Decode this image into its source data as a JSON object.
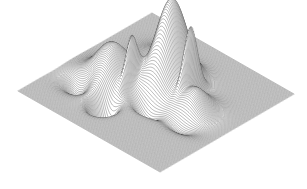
{
  "figure": {
    "title": "",
    "background_color": "#ffffff",
    "mesh_color": "#2b2b2b",
    "fill_color": "#ffffff",
    "width_px": 307,
    "height_px": 189
  },
  "chart_data": {
    "type": "surface",
    "render_style": "wireframe-mesh",
    "title": "",
    "subtitle": "",
    "xlabel": "",
    "ylabel": "",
    "zlabel": "",
    "legend": [],
    "annotations": [],
    "grid": false,
    "axes_visible": false,
    "tick_labels": [],
    "colormap": "grayscale",
    "xlim": [
      -3,
      3
    ],
    "ylim": [
      -3,
      3
    ],
    "zlim": [
      -6.5,
      8.5
    ],
    "grid_resolution": {
      "nx": 170,
      "ny": 170
    },
    "projection": {
      "type": "isometric-diamond",
      "azimuth_deg": -37.5,
      "elevation_deg": 30,
      "corners_px": {
        "left": [
          18,
          91
        ],
        "top": [
          152,
          13
        ],
        "right": [
          297,
          88
        ],
        "bottom": [
          160,
          172
        ]
      },
      "z_scale_px": 9.2,
      "origin_px": [
        156,
        92
      ]
    },
    "surface_function": "sum of anisotropic gaussians on a flat base plane",
    "components": [
      {
        "name": "main-central-peak",
        "amplitude": 9.4,
        "cx": 0.08,
        "cy": 0.62,
        "sx": 0.62,
        "sy": 0.74,
        "rot_deg": 0
      },
      {
        "name": "narrow-right-spike",
        "amplitude": 6.1,
        "cx": 0.98,
        "cy": 0.52,
        "sx": 0.11,
        "sy": 0.4,
        "rot_deg": 0
      },
      {
        "name": "narrow-left-spike",
        "amplitude": 4.3,
        "cx": -0.62,
        "cy": -0.44,
        "sx": 0.1,
        "sy": 0.34,
        "rot_deg": 0
      },
      {
        "name": "broad-left-bump",
        "amplitude": 4.0,
        "cx": -1.42,
        "cy": -0.52,
        "sx": 0.78,
        "sy": 0.86,
        "rot_deg": 0
      },
      {
        "name": "right-shoulder-ridge",
        "amplitude": 2.5,
        "cx": 1.52,
        "cy": 0.1,
        "sx": 0.62,
        "sy": 0.62,
        "rot_deg": 0
      },
      {
        "name": "deep-front-dip",
        "amplitude": -6.4,
        "cx": -0.72,
        "cy": -1.62,
        "sx": 0.34,
        "sy": 0.36,
        "rot_deg": 0
      },
      {
        "name": "left-trough",
        "amplitude": -2.2,
        "cx": -1.95,
        "cy": -1.35,
        "sx": 0.55,
        "sy": 0.45,
        "rot_deg": 0
      },
      {
        "name": "center-front-trough",
        "amplitude": -2.0,
        "cx": 0.28,
        "cy": -0.72,
        "sx": 0.55,
        "sy": 0.3,
        "rot_deg": 0
      },
      {
        "name": "right-front-trough",
        "amplitude": -1.5,
        "cx": 1.62,
        "cy": -0.62,
        "sx": 0.6,
        "sy": 0.36,
        "rot_deg": 0
      },
      {
        "name": "back-left-rise",
        "amplitude": 1.1,
        "cx": -1.05,
        "cy": 1.35,
        "sx": 0.8,
        "sy": 0.6,
        "rot_deg": 0
      }
    ],
    "peaks_px": [
      {
        "name": "central-peak-apex",
        "x": 152,
        "y": 14,
        "relative_height": 1.0
      },
      {
        "name": "right-spike-apex",
        "x": 190,
        "y": 45,
        "relative_height": 0.66
      },
      {
        "name": "left-spike-apex",
        "x": 116,
        "y": 94,
        "relative_height": 0.46
      },
      {
        "name": "broad-bump-crest",
        "x": 76,
        "y": 104,
        "relative_height": 0.43
      },
      {
        "name": "front-dip-bottom",
        "x": 105,
        "y": 168,
        "relative_height": -0.68
      }
    ],
    "series": [
      {
        "name": "surface-mesh-rows",
        "count": 170,
        "orientation": "constant-y"
      }
    ]
  }
}
